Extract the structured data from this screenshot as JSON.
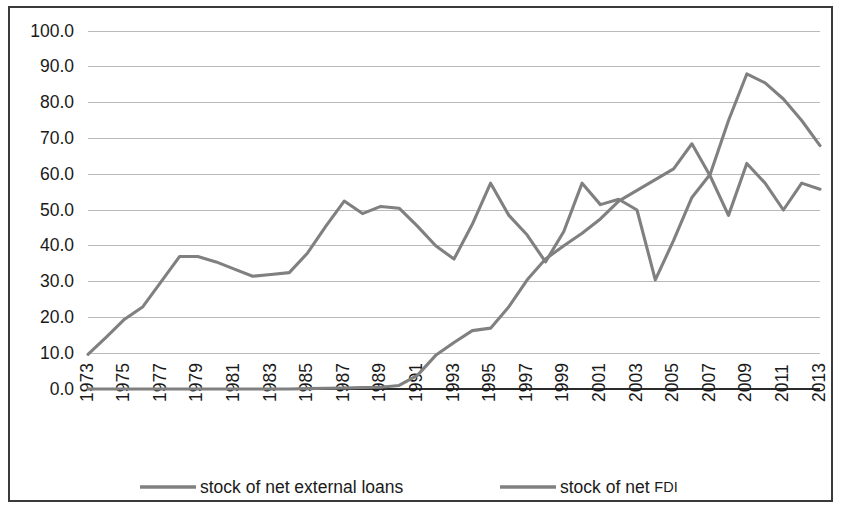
{
  "figure": {
    "background_color": "#ffffff",
    "border_color": "#3a3a3a",
    "line_color": "#808080",
    "gridline_color": "#b9b9b9",
    "axis_color": "#2b2b2b"
  },
  "legend": {
    "position": "bottom",
    "entries": [
      {
        "label": "stock of net external loans",
        "color": "#808080"
      },
      {
        "label_main": "stock of net ",
        "label_small": "FDI",
        "label": "stock of net FDI",
        "color": "#808080"
      }
    ]
  },
  "chart_data": {
    "type": "line",
    "title": "",
    "subtitle": "",
    "xlabel": "",
    "ylabel": "",
    "xlim": [
      1973,
      2013
    ],
    "ylim": [
      0.0,
      100.0
    ],
    "grid": true,
    "legend_position": "bottom",
    "y_ticks": [
      0.0,
      10.0,
      20.0,
      30.0,
      40.0,
      50.0,
      60.0,
      70.0,
      80.0,
      90.0,
      100.0
    ],
    "y_tick_labels": [
      "0.0",
      "10.0",
      "20.0",
      "30.0",
      "40.0",
      "50.0",
      "60.0",
      "70.0",
      "80.0",
      "90.0",
      "100.0"
    ],
    "x_tick_labels": [
      "1973",
      "1975",
      "1977",
      "1979",
      "1981",
      "1983",
      "1985",
      "1987",
      "1989",
      "1991",
      "1993",
      "1995",
      "1997",
      "1999",
      "2001",
      "2003",
      "2005",
      "2007",
      "2009",
      "2011",
      "2013"
    ],
    "x": [
      1973,
      1974,
      1975,
      1976,
      1977,
      1978,
      1979,
      1980,
      1981,
      1982,
      1983,
      1984,
      1985,
      1986,
      1987,
      1988,
      1989,
      1990,
      1991,
      1992,
      1993,
      1994,
      1995,
      1996,
      1997,
      1998,
      1999,
      2000,
      2001,
      2002,
      2003,
      2004,
      2005,
      2006,
      2007,
      2008,
      2009,
      2010,
      2011,
      2012,
      2013
    ],
    "series": [
      {
        "name": "stock of net external loans",
        "color": "#808080",
        "values": [
          0.0,
          0.0,
          0.0,
          0.0,
          0.0,
          0.0,
          0.0,
          0.0,
          0.0,
          0.0,
          0.0,
          0.0,
          0.1,
          0.2,
          0.3,
          0.4,
          0.5,
          1.0,
          3.8,
          9.4,
          13.0,
          16.3,
          17.0,
          23.0,
          30.5,
          36.3,
          40.0,
          43.5,
          47.5,
          52.5,
          55.5,
          58.5,
          61.5,
          68.5,
          59.5,
          48.5,
          63.0,
          57.5,
          50.0,
          57.5,
          55.8
        ]
      },
      {
        "name": "stock of net FDI",
        "color": "#808080",
        "values": [
          9.7,
          14.5,
          19.5,
          23.0,
          30.0,
          37.0,
          37.0,
          35.5,
          33.5,
          31.5,
          32.0,
          32.5,
          38.0,
          45.5,
          52.5,
          49.0,
          51.0,
          50.5,
          45.5,
          40.0,
          36.3,
          46.0,
          57.5,
          48.5,
          43.0,
          35.5,
          44.0,
          57.5,
          51.5,
          53.0,
          50.0,
          30.5,
          41.5,
          53.5,
          60.0,
          75.0,
          88.0,
          85.5,
          81.0,
          75.0,
          68.0
        ]
      }
    ]
  }
}
